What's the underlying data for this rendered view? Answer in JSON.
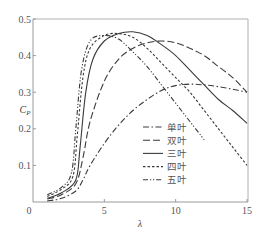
{
  "chart_data": {
    "type": "line",
    "title": "",
    "xlabel": "λ",
    "ylabel": "C_P",
    "xlim": [
      0,
      15
    ],
    "ylim": [
      0,
      0.5
    ],
    "xticks": [
      "0",
      "5",
      "10",
      "15"
    ],
    "yticks": [
      "0.1",
      "0.2",
      "0.3",
      "0.4",
      "0.5"
    ],
    "origin_label": "0",
    "grid": false,
    "legend_position": "lower-center-right inside",
    "series": [
      {
        "name": "单叶",
        "style": "dash-dot",
        "x": [
          1,
          2,
          3,
          3.5,
          4,
          5,
          6,
          7,
          8,
          9,
          10,
          11,
          12,
          13,
          14,
          15
        ],
        "y": [
          0.003,
          0.01,
          0.03,
          0.06,
          0.1,
          0.16,
          0.21,
          0.25,
          0.28,
          0.305,
          0.318,
          0.322,
          0.32,
          0.315,
          0.308,
          0.3
        ]
      },
      {
        "name": "双叶",
        "style": "dashed",
        "x": [
          1,
          2,
          3,
          3.5,
          4,
          5,
          6,
          7,
          8,
          9,
          10,
          11,
          12,
          13,
          14,
          15
        ],
        "y": [
          0.008,
          0.02,
          0.05,
          0.12,
          0.22,
          0.33,
          0.39,
          0.42,
          0.435,
          0.44,
          0.435,
          0.42,
          0.4,
          0.37,
          0.34,
          0.3
        ]
      },
      {
        "name": "三叶",
        "style": "solid",
        "x": [
          1,
          2,
          3,
          3.3,
          3.7,
          4.2,
          5,
          6,
          7,
          8,
          9,
          10,
          11,
          12,
          13,
          14,
          15
        ],
        "y": [
          0.01,
          0.025,
          0.06,
          0.15,
          0.3,
          0.39,
          0.44,
          0.46,
          0.465,
          0.455,
          0.43,
          0.4,
          0.36,
          0.32,
          0.28,
          0.25,
          0.215
        ]
      },
      {
        "name": "四叶",
        "style": "short-dash",
        "x": [
          1,
          2,
          2.8,
          3.1,
          3.5,
          4,
          5,
          6,
          7,
          8,
          9,
          10,
          11,
          12,
          13,
          14,
          15
        ],
        "y": [
          0.015,
          0.035,
          0.07,
          0.18,
          0.34,
          0.42,
          0.455,
          0.46,
          0.45,
          0.42,
          0.38,
          0.34,
          0.3,
          0.25,
          0.2,
          0.15,
          0.1
        ]
      },
      {
        "name": "五叶",
        "style": "dash-dot-dot",
        "x": [
          1,
          2,
          2.7,
          3,
          3.4,
          4,
          5,
          6,
          7,
          8,
          9,
          10,
          11,
          12
        ],
        "y": [
          0.02,
          0.04,
          0.08,
          0.2,
          0.36,
          0.44,
          0.455,
          0.445,
          0.41,
          0.37,
          0.32,
          0.27,
          0.22,
          0.17
        ]
      }
    ]
  },
  "axes": {
    "x_label": "λ",
    "y_label_main": "C",
    "y_label_sub": "P"
  },
  "legend": {
    "items": [
      "单叶",
      "双叶",
      "三叶",
      "四叶",
      "五叶"
    ]
  },
  "colors": {
    "line": "#3a3a3a",
    "axis": "#9a9a9a"
  }
}
